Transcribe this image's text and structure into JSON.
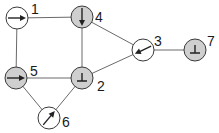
{
  "diagram": {
    "type": "graph",
    "fill_colors": {
      "shaded": "#cfcfcf",
      "unshaded": "#ffffff"
    },
    "nodes": [
      {
        "id": "1",
        "label": "1",
        "x": 17,
        "y": 18,
        "shaded": false,
        "symbol": "arrow",
        "angle": 0,
        "label_dx": 14,
        "label_dy": -4
      },
      {
        "id": "2",
        "label": "2",
        "x": 82,
        "y": 78,
        "shaded": true,
        "symbol": "bottom",
        "angle": 0,
        "label_dx": 15,
        "label_dy": 13
      },
      {
        "id": "3",
        "label": "3",
        "x": 143,
        "y": 50,
        "shaded": false,
        "symbol": "arrow",
        "angle": 155,
        "label_dx": 11,
        "label_dy": -4
      },
      {
        "id": "4",
        "label": "4",
        "x": 82,
        "y": 17,
        "shaded": true,
        "symbol": "arrow",
        "angle": 90,
        "label_dx": 13,
        "label_dy": 5
      },
      {
        "id": "5",
        "label": "5",
        "x": 16,
        "y": 78,
        "shaded": true,
        "symbol": "arrow",
        "angle": 0,
        "label_dx": 14,
        "label_dy": -2
      },
      {
        "id": "6",
        "label": "6",
        "x": 49,
        "y": 118,
        "shaded": false,
        "symbol": "arrow",
        "angle": -50,
        "label_dx": 13,
        "label_dy": 9
      },
      {
        "id": "7",
        "label": "7",
        "x": 195,
        "y": 50,
        "shaded": true,
        "symbol": "bottom",
        "angle": 0,
        "label_dx": 12,
        "label_dy": -4
      }
    ],
    "edges": [
      [
        "1",
        "4"
      ],
      [
        "1",
        "5"
      ],
      [
        "4",
        "2"
      ],
      [
        "4",
        "3"
      ],
      [
        "3",
        "2"
      ],
      [
        "3",
        "7"
      ],
      [
        "5",
        "2"
      ],
      [
        "5",
        "6"
      ],
      [
        "6",
        "2"
      ]
    ],
    "node_radius": 11
  }
}
